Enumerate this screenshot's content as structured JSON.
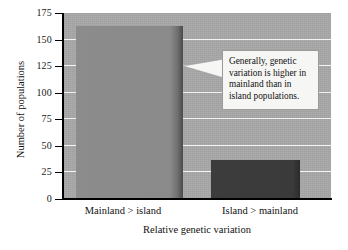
{
  "chart_data": {
    "type": "bar",
    "title": "",
    "categories": [
      "Mainland > island",
      "Island > mainland"
    ],
    "values": [
      163,
      37
    ],
    "series": [
      {
        "name": "Number of populations",
        "values": [
          163,
          37
        ]
      }
    ],
    "xlabel": "Relative genetic variation",
    "ylabel": "Number of populations",
    "ylim": [
      0,
      175
    ],
    "yticks": [
      0,
      25,
      50,
      75,
      100,
      125,
      150,
      175
    ],
    "ytick_labels": [
      "0",
      "25",
      "50",
      "75",
      "100",
      "125",
      "150",
      "175"
    ],
    "grid": true,
    "legend": "none",
    "annotations": [
      {
        "text": "Generally, genetic variation is higher in mainland than in island populations.",
        "points_to": "Mainland > island"
      }
    ],
    "colors": {
      "plot_background": "#a8a8a8",
      "gridline": "#f2f2f2",
      "bar_mainland": "#8a8a8a",
      "bar_island": "#3a3a3a",
      "axis": "#000000",
      "callout_background": "#f6f6f4",
      "callout_border": "#9a9a9a",
      "text": "#111111"
    }
  },
  "axes": {
    "y_title": "Number of populations",
    "x_title": "Relative genetic variation",
    "y_ticks": [
      {
        "label": "175",
        "value": 175
      },
      {
        "label": "150",
        "value": 150
      },
      {
        "label": "125",
        "value": 125
      },
      {
        "label": "100",
        "value": 100
      },
      {
        "label": "75",
        "value": 75
      },
      {
        "label": "50",
        "value": 50
      },
      {
        "label": "25",
        "value": 25
      },
      {
        "label": "0",
        "value": 0
      }
    ],
    "x_categories": [
      {
        "label": "Mainland > island"
      },
      {
        "label": "Island > mainland"
      }
    ]
  },
  "callout": {
    "text": "Generally, genetic variation is higher in mainland than in island populations."
  }
}
